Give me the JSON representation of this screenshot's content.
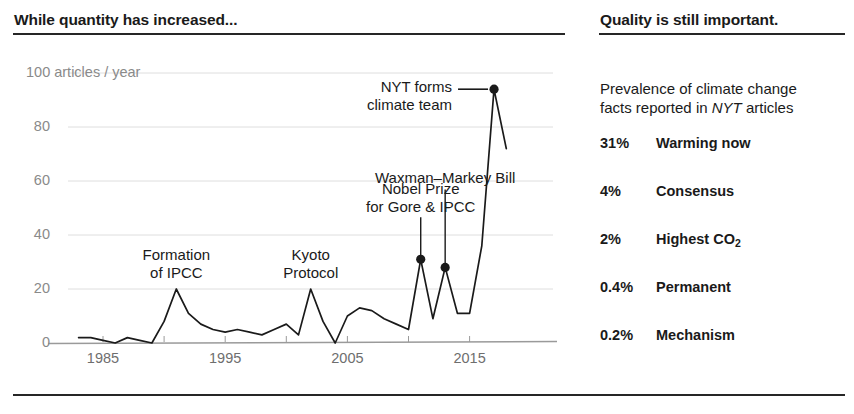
{
  "left_panel": {
    "title": "While quantity has increased..."
  },
  "right_panel": {
    "title": "Quality is still important.",
    "description_line1": "Prevalence of climate change",
    "description_line2_pre": "facts reported in ",
    "description_line2_em": "NYT",
    "description_line2_post": " articles",
    "stats": [
      {
        "pct": "31%",
        "label": "Warming now"
      },
      {
        "pct": "4%",
        "label": "Consensus"
      },
      {
        "pct": "2%",
        "label": "Highest CO",
        "sub": "2"
      },
      {
        "pct": "0.4%",
        "label": "Permanent"
      },
      {
        "pct": "0.2%",
        "label": "Mechanism"
      }
    ]
  },
  "chart_data": {
    "type": "line",
    "title": "While quantity has increased...",
    "xlabel": "",
    "ylabel": "100 articles / year",
    "unit_label": "100 articles / year",
    "grid": true,
    "legend_position": "none",
    "xlim": [
      1982,
      1983
    ],
    "ylim": [
      0,
      100
    ],
    "yticks": [
      0,
      20,
      40,
      60,
      80,
      100
    ],
    "ytick_labels": [
      "0",
      "20",
      "40",
      "60",
      "80",
      "100"
    ],
    "xticks": [
      1985,
      1990,
      1995,
      2000,
      2005,
      2010,
      2015
    ],
    "xtick_labels": [
      "1985",
      "",
      "1995",
      "",
      "2005",
      "",
      "2015"
    ],
    "x": [
      1983,
      1984,
      1985,
      1986,
      1987,
      1988,
      1989,
      1990,
      1991,
      1992,
      1993,
      1994,
      1995,
      1996,
      1997,
      1998,
      1999,
      2000,
      2001,
      2002,
      2003,
      2004,
      2005,
      2006,
      2007,
      2008,
      2009,
      2010,
      2011,
      2012,
      2013,
      2014,
      2015,
      2016,
      2017,
      2018
    ],
    "y": [
      2,
      2,
      1,
      0,
      2,
      1,
      0,
      8,
      20,
      11,
      7,
      5,
      4,
      5,
      4,
      3,
      5,
      7,
      3,
      20,
      8,
      0,
      10,
      13,
      12,
      9,
      7,
      5,
      31,
      9,
      28,
      11,
      11,
      36,
      94,
      72
    ],
    "markers": [
      {
        "x": 2011,
        "y": 31
      },
      {
        "x": 2013,
        "y": 28
      },
      {
        "x": 2017,
        "y": 94
      }
    ],
    "annotations": [
      {
        "name": "formation-of-ipcc",
        "line1": "Formation",
        "line2": "of IPCC",
        "x": 1991,
        "y": 20,
        "leader": false
      },
      {
        "name": "kyoto-protocol",
        "line1": "Kyoto",
        "line2": "Protocol",
        "x": 2002,
        "y": 20,
        "leader": false
      },
      {
        "name": "nobel-prize",
        "line1": "Nobel Prize",
        "line2": "for Gore & IPCC",
        "x": 2011,
        "y": 31,
        "leader": "vertical"
      },
      {
        "name": "waxman-markey-bill",
        "line1": "Waxman–Markey Bill",
        "line2": "",
        "x": 2013,
        "y": 28,
        "leader": "vertical"
      },
      {
        "name": "nyt-forms-climate-team",
        "line1": "NYT forms",
        "line2": "climate team",
        "x": 2017,
        "y": 94,
        "leader": "horizontal"
      }
    ]
  }
}
